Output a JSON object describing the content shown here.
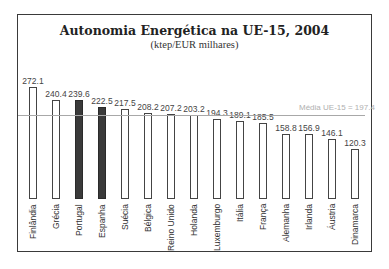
{
  "chart_data": {
    "type": "bar",
    "title": "Autonomia Energética na UE-15, 2004",
    "subtitle": "(ktep/EUR milhares)",
    "xlabel": "",
    "ylabel": "",
    "categories": [
      "Finlândia",
      "Grécia",
      "Portugal",
      "Espanha",
      "Suécia",
      "Bélgica",
      "Reino Unido",
      "Holanda",
      "Luxemburgo",
      "Itália",
      "França",
      "Alemanha",
      "Irlanda",
      "Áustria",
      "Dinamarca"
    ],
    "values": [
      272.1,
      240.4,
      239.6,
      222.5,
      217.5,
      208.2,
      207.2,
      203.2,
      194.3,
      189.1,
      185.5,
      158.8,
      156.9,
      146.1,
      120.3
    ],
    "value_labels": [
      "272.1",
      "240.4",
      "239.6",
      "222.5",
      "217.5",
      "208.2",
      "207.2",
      "203.2",
      "194.3",
      "189.1",
      "185.5",
      "158.8",
      "156.9",
      "146.1",
      "120.3"
    ],
    "highlighted": [
      "Portugal",
      "Espanha"
    ],
    "reference_line": {
      "label": "Média UE-15 = 197.4",
      "value": 197.4
    },
    "ylim": [
      0,
      280
    ],
    "grid": false,
    "legend": null
  },
  "colors": {
    "bar_fill": "#ffffff",
    "bar_highlight": "#3a3a3a",
    "reference_line": "#a8a8a8",
    "frame": "#3a3a3a"
  }
}
